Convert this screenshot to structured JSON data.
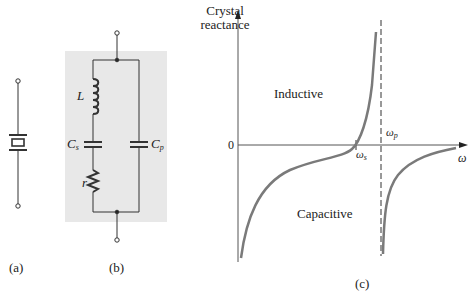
{
  "figure": {
    "panel_a": {
      "label": "(a)",
      "description": "crystal-symbol"
    },
    "panel_b": {
      "label": "(b)",
      "components": {
        "inductor": "L",
        "series_capacitor": {
          "base": "C",
          "sub": "s"
        },
        "resistor": "r",
        "parallel_capacitor": {
          "base": "C",
          "sub": "p"
        }
      },
      "background_color": "#e8e8e8"
    },
    "panel_c": {
      "label": "(c)",
      "y_axis_label_line1": "Crystal",
      "y_axis_label_line2": "reactance",
      "zero_label": "0",
      "x_axis_label": "ω",
      "region_inductive": "Inductive",
      "region_capacitive": "Capacitive",
      "omega_s": {
        "base": "ω",
        "sub": "s"
      },
      "omega_p": {
        "base": "ω",
        "sub": "p"
      },
      "curve_color": "#7a7a7a"
    }
  }
}
